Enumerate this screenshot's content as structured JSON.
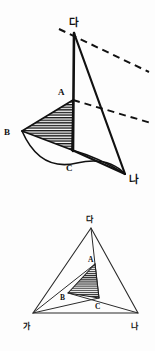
{
  "figure": {
    "background_color": "#fdfdfd",
    "ink_color": "#111111",
    "hatch_color": "#1a1a1a",
    "top_diagram": {
      "name": "cone-with-cross-section",
      "labels": {
        "apex": "다",
        "right_vertex": "나",
        "point_a": "A",
        "point_b": "B",
        "point_c": "C"
      },
      "points": {
        "apex_da": [
          74,
          33
        ],
        "point_a": [
          73,
          100
        ],
        "point_b": [
          22,
          131
        ],
        "point_c": [
          72,
          150
        ],
        "vertex_na": [
          125,
          174
        ]
      },
      "label_positions": {
        "apex_da": [
          69,
          26
        ],
        "point_a": [
          60,
          94
        ],
        "point_b": [
          6,
          132
        ],
        "point_c": [
          67,
          169
        ],
        "vertex_na": [
          130,
          181
        ]
      },
      "dashed_lines": [
        {
          "name": "upper-dashed-line",
          "from": [
            59,
            29
          ],
          "to": [
            149,
            72
          ]
        },
        {
          "name": "lower-dashed-line",
          "from": [
            73,
            100
          ],
          "to": [
            151,
            123
          ]
        }
      ],
      "shaded_region": {
        "name": "hatched-cross-section",
        "vertices": [
          [
            73,
            100
          ],
          [
            22,
            131
          ],
          [
            72,
            150
          ]
        ],
        "fill": "hatch"
      }
    },
    "bottom_diagram": {
      "name": "triangle-base-projection",
      "labels": {
        "apex": "다",
        "left_vertex": "가",
        "right_vertex": "나",
        "point_a": "A",
        "point_b": "B",
        "point_c": "C"
      },
      "points": {
        "apex_da": [
          91,
          228
        ],
        "vertex_ga": [
          33,
          313
        ],
        "vertex_na": [
          138,
          313
        ],
        "point_a": [
          95,
          264
        ],
        "point_b": [
          68,
          293
        ],
        "point_c": [
          99,
          298
        ]
      },
      "label_positions": {
        "apex_da": [
          86,
          221
        ],
        "vertex_ga": [
          26,
          327
        ],
        "vertex_na": [
          134,
          327
        ],
        "point_a": [
          89,
          261
        ],
        "point_b": [
          62,
          299
        ],
        "point_c": [
          96,
          308
        ]
      },
      "shaded_region": {
        "name": "hatched-inner-triangle",
        "vertices": [
          [
            95,
            264
          ],
          [
            68,
            293
          ],
          [
            99,
            298
          ]
        ],
        "fill": "hatch"
      }
    }
  }
}
